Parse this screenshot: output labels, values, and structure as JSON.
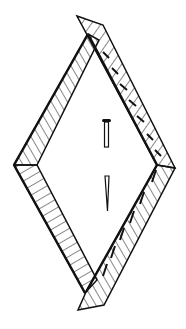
{
  "illustration": {
    "subject": "diamond-shaped wooden frame of four hatched boards with a nail",
    "colors": {
      "ink": "#111111",
      "background": "#ffffff"
    },
    "parts": {
      "boards": [
        "upper-left board",
        "upper-right board",
        "lower-left board",
        "lower-right board"
      ],
      "nail": "nail"
    }
  }
}
